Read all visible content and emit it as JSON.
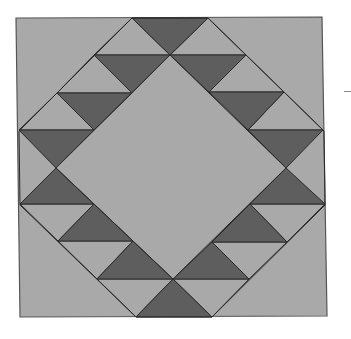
{
  "diagram": {
    "colors": {
      "background": "#ffffff",
      "light": "#a9a9a9",
      "dark": "#5e5e5e",
      "stroke": "#2a2a2a",
      "border": "#555555"
    },
    "outer_square": [
      [
        16,
        18
      ],
      [
        322,
        17
      ],
      [
        327,
        316
      ],
      [
        20,
        317
      ]
    ],
    "inner_diamond": [
      [
        170,
        55
      ],
      [
        286,
        168
      ],
      [
        173,
        279
      ],
      [
        56,
        168
      ]
    ],
    "outer_diamond": [
      [
        132,
        18
      ],
      [
        208,
        18
      ],
      [
        324,
        131
      ],
      [
        325,
        205
      ],
      [
        212,
        317
      ],
      [
        136,
        317
      ],
      [
        20,
        205
      ],
      [
        19,
        131
      ]
    ],
    "dark_triangles": [
      [
        [
          132,
          18
        ],
        [
          208,
          18
        ],
        [
          170,
          55
        ]
      ],
      [
        [
          94,
          55
        ],
        [
          170,
          55
        ],
        [
          132,
          93
        ]
      ],
      [
        [
          57,
          93
        ],
        [
          132,
          93
        ],
        [
          94,
          130
        ]
      ],
      [
        [
          19,
          130
        ],
        [
          94,
          130
        ],
        [
          56,
          168
        ]
      ],
      [
        [
          170,
          55
        ],
        [
          246,
          55
        ],
        [
          209,
          92
        ]
      ],
      [
        [
          209,
          92
        ],
        [
          284,
          92
        ],
        [
          248,
          130
        ]
      ],
      [
        [
          248,
          130
        ],
        [
          323,
          130
        ],
        [
          286,
          168
        ]
      ],
      [
        [
          56,
          168
        ],
        [
          20,
          204
        ],
        [
          94,
          204
        ]
      ],
      [
        [
          94,
          204
        ],
        [
          58,
          241
        ],
        [
          133,
          241
        ]
      ],
      [
        [
          133,
          241
        ],
        [
          97,
          279
        ],
        [
          173,
          279
        ]
      ],
      [
        [
          286,
          168
        ],
        [
          250,
          204
        ],
        [
          325,
          204
        ]
      ],
      [
        [
          250,
          204
        ],
        [
          212,
          242
        ],
        [
          287,
          242
        ]
      ],
      [
        [
          212,
          242
        ],
        [
          173,
          279
        ],
        [
          249,
          279
        ]
      ],
      [
        [
          173,
          279
        ],
        [
          136,
          317
        ],
        [
          212,
          317
        ]
      ]
    ],
    "light_triangles": [
      [
        [
          94,
          55
        ],
        [
          132,
          18
        ],
        [
          170,
          55
        ]
      ],
      [
        [
          57,
          93
        ],
        [
          94,
          55
        ],
        [
          132,
          93
        ]
      ],
      [
        [
          19,
          130
        ],
        [
          57,
          93
        ],
        [
          94,
          130
        ]
      ],
      [
        [
          170,
          55
        ],
        [
          208,
          18
        ],
        [
          246,
          55
        ]
      ],
      [
        [
          209,
          92
        ],
        [
          246,
          55
        ],
        [
          284,
          92
        ]
      ],
      [
        [
          248,
          130
        ],
        [
          284,
          92
        ],
        [
          323,
          130
        ]
      ],
      [
        [
          20,
          204
        ],
        [
          94,
          204
        ],
        [
          58,
          241
        ]
      ],
      [
        [
          58,
          241
        ],
        [
          133,
          241
        ],
        [
          97,
          279
        ]
      ],
      [
        [
          97,
          279
        ],
        [
          173,
          279
        ],
        [
          136,
          317
        ]
      ],
      [
        [
          250,
          204
        ],
        [
          325,
          204
        ],
        [
          287,
          242
        ]
      ],
      [
        [
          212,
          242
        ],
        [
          287,
          242
        ],
        [
          249,
          279
        ]
      ],
      [
        [
          173,
          279
        ],
        [
          249,
          279
        ],
        [
          212,
          317
        ]
      ]
    ],
    "side_mark": "dash"
  }
}
